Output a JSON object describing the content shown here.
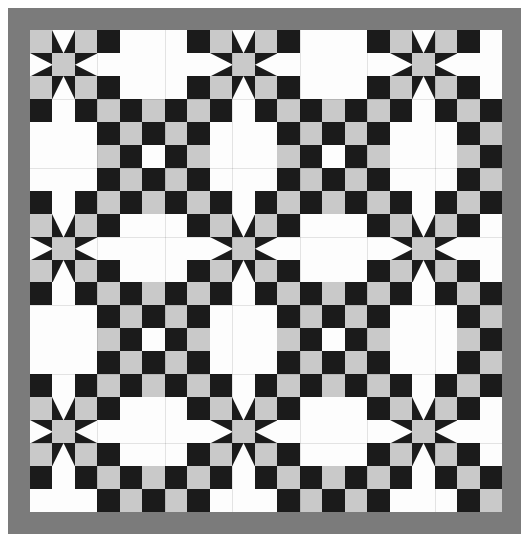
{
  "artwork": {
    "name": "Sawtooth Star and Double Irish Chain Quilt",
    "type": "pieced-quilt-top",
    "shape": "square-sampler-grid"
  },
  "canvas": {
    "width": 529,
    "height": 546,
    "background": "#ffffff"
  },
  "palette": {
    "background_white": "#ffffff",
    "patch_white": "#fdfdfd",
    "patch_gray": "#c9c9c9",
    "patch_black": "#1b1b1b",
    "border_gray": "#7b7b7b",
    "seam_line": "rgba(0,0,0,0.10)"
  },
  "mat": {
    "label": "outer-white-margin",
    "x": 4,
    "y": 4,
    "width": 521,
    "height": 538
  },
  "border": {
    "label": "gray-sashing-border",
    "color": "#7b7b7b",
    "x": 8,
    "y": 8,
    "width": 513,
    "height": 526,
    "thickness": 22
  },
  "field": {
    "label": "pieced-quilt-field",
    "x": 30,
    "y": 30,
    "width": 472,
    "height": 482,
    "grid_cols": 21,
    "grid_rows": 21,
    "cell_width": 22.48,
    "cell_height": 22.95
  },
  "blocks": {
    "grid_cols": 7,
    "grid_rows": 7,
    "cells_per_block": 3,
    "star_positions": "blocks where both row and column indices are even",
    "alternate_positions": "blocks where row or column index is odd",
    "star_block": {
      "name": "sawtooth-star",
      "corner_color": "#c9c9c9",
      "center_color": "#c9c9c9",
      "point_background": "#1b1b1b",
      "point_color": "#fdfdfd",
      "units": 9
    },
    "chain_block": {
      "name": "irish-chain-checkerboard",
      "colors": [
        "#1b1b1b",
        "#c9c9c9",
        "#fdfdfd"
      ]
    },
    "plain_block": {
      "name": "plain-white-square",
      "color": "#fdfdfd"
    }
  },
  "chart_data": {
    "type": "heatmap",
    "xlabel": "",
    "ylabel": "",
    "grid": true,
    "legend": [
      "black",
      "gray",
      "white",
      "geese-up",
      "geese-down",
      "geese-left",
      "geese-right"
    ],
    "categories": [
      "col0",
      "col1",
      "col2",
      "col3",
      "col4",
      "col5",
      "col6",
      "col7",
      "col8",
      "col9",
      "col10",
      "col11",
      "col12",
      "col13",
      "col14",
      "col15",
      "col16",
      "col17",
      "col18",
      "col19",
      "col20"
    ],
    "values": [
      [
        "G",
        "Nd",
        "G",
        "K",
        "W",
        "W",
        "W",
        "K",
        "G",
        "Nd",
        "G",
        "K",
        "W",
        "W",
        "W",
        "K",
        "G",
        "Nd",
        "G",
        "K",
        "W"
      ],
      [
        "Ne",
        "G",
        "Nw",
        "W",
        "W",
        "W",
        "W",
        "W",
        "Ne",
        "G",
        "Nw",
        "W",
        "W",
        "W",
        "W",
        "W",
        "Ne",
        "G",
        "Nw",
        "W",
        "W"
      ],
      [
        "G",
        "Nu",
        "G",
        "K",
        "W",
        "W",
        "W",
        "K",
        "G",
        "Nu",
        "G",
        "K",
        "W",
        "W",
        "W",
        "K",
        "G",
        "Nu",
        "G",
        "K",
        "W"
      ],
      [
        "K",
        "W",
        "K",
        "G",
        "K",
        "G",
        "K",
        "G",
        "K",
        "W",
        "K",
        "G",
        "K",
        "G",
        "K",
        "G",
        "K",
        "W",
        "K",
        "G",
        "K"
      ],
      [
        "W",
        "W",
        "W",
        "K",
        "G",
        "K",
        "G",
        "K",
        "W",
        "W",
        "W",
        "K",
        "G",
        "K",
        "G",
        "K",
        "W",
        "W",
        "W",
        "K",
        "G"
      ],
      [
        "W",
        "W",
        "W",
        "G",
        "K",
        "W",
        "K",
        "G",
        "W",
        "W",
        "W",
        "G",
        "K",
        "W",
        "K",
        "G",
        "W",
        "W",
        "W",
        "G",
        "K"
      ],
      [
        "W",
        "W",
        "W",
        "K",
        "G",
        "K",
        "G",
        "K",
        "W",
        "W",
        "W",
        "K",
        "G",
        "K",
        "G",
        "K",
        "W",
        "W",
        "W",
        "K",
        "G"
      ],
      [
        "K",
        "W",
        "K",
        "G",
        "K",
        "G",
        "K",
        "G",
        "K",
        "W",
        "K",
        "G",
        "K",
        "G",
        "K",
        "G",
        "K",
        "W",
        "K",
        "G",
        "K"
      ],
      [
        "G",
        "Nd",
        "G",
        "K",
        "W",
        "W",
        "W",
        "K",
        "G",
        "Nd",
        "G",
        "K",
        "W",
        "W",
        "W",
        "K",
        "G",
        "Nd",
        "G",
        "K",
        "W"
      ],
      [
        "Ne",
        "G",
        "Nw",
        "W",
        "W",
        "W",
        "W",
        "W",
        "Ne",
        "G",
        "Nw",
        "W",
        "W",
        "W",
        "W",
        "W",
        "Ne",
        "G",
        "Nw",
        "W",
        "W"
      ],
      [
        "G",
        "Nu",
        "G",
        "K",
        "W",
        "W",
        "W",
        "K",
        "G",
        "Nu",
        "G",
        "K",
        "W",
        "W",
        "W",
        "K",
        "G",
        "Nu",
        "G",
        "K",
        "W"
      ],
      [
        "K",
        "W",
        "K",
        "G",
        "K",
        "G",
        "K",
        "G",
        "K",
        "W",
        "K",
        "G",
        "K",
        "G",
        "K",
        "G",
        "K",
        "W",
        "K",
        "G",
        "K"
      ],
      [
        "W",
        "W",
        "W",
        "K",
        "G",
        "K",
        "G",
        "K",
        "W",
        "W",
        "W",
        "K",
        "G",
        "K",
        "G",
        "K",
        "W",
        "W",
        "W",
        "K",
        "G"
      ],
      [
        "W",
        "W",
        "W",
        "G",
        "K",
        "W",
        "K",
        "G",
        "W",
        "W",
        "W",
        "G",
        "K",
        "W",
        "K",
        "G",
        "W",
        "W",
        "W",
        "G",
        "K"
      ],
      [
        "W",
        "W",
        "W",
        "K",
        "G",
        "K",
        "G",
        "K",
        "W",
        "W",
        "W",
        "K",
        "G",
        "K",
        "G",
        "K",
        "W",
        "W",
        "W",
        "K",
        "G"
      ],
      [
        "K",
        "W",
        "K",
        "G",
        "K",
        "G",
        "K",
        "G",
        "K",
        "W",
        "K",
        "G",
        "K",
        "G",
        "K",
        "G",
        "K",
        "W",
        "K",
        "G",
        "K"
      ],
      [
        "G",
        "Nd",
        "G",
        "K",
        "W",
        "W",
        "W",
        "K",
        "G",
        "Nd",
        "G",
        "K",
        "W",
        "W",
        "W",
        "K",
        "G",
        "Nd",
        "G",
        "K",
        "W"
      ],
      [
        "Ne",
        "G",
        "Nw",
        "W",
        "W",
        "W",
        "W",
        "W",
        "Ne",
        "G",
        "Nw",
        "W",
        "W",
        "W",
        "W",
        "W",
        "Ne",
        "G",
        "Nw",
        "W",
        "W"
      ],
      [
        "G",
        "Nu",
        "G",
        "K",
        "W",
        "W",
        "W",
        "K",
        "G",
        "Nu",
        "G",
        "K",
        "W",
        "W",
        "W",
        "K",
        "G",
        "Nu",
        "G",
        "K",
        "W"
      ],
      [
        "K",
        "W",
        "K",
        "G",
        "K",
        "G",
        "K",
        "G",
        "K",
        "W",
        "K",
        "G",
        "K",
        "G",
        "K",
        "G",
        "K",
        "W",
        "K",
        "G",
        "K"
      ],
      [
        "W",
        "W",
        "W",
        "K",
        "G",
        "K",
        "G",
        "K",
        "W",
        "W",
        "W",
        "K",
        "G",
        "K",
        "G",
        "K",
        "W",
        "W",
        "W",
        "K",
        "G"
      ]
    ],
    "value_key": {
      "K": "black patch",
      "G": "gray patch",
      "W": "white patch",
      "Nu": "flying geese point up",
      "Nd": "flying geese point down",
      "Ne": "flying geese point right",
      "Nw": "flying geese point left"
    }
  }
}
